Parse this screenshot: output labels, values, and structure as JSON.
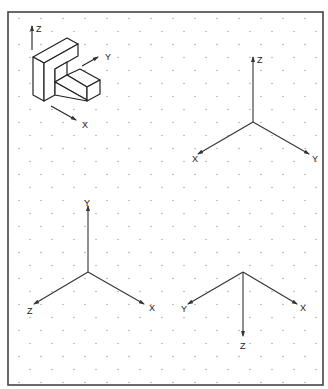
{
  "diagram": {
    "frame_color": "#444444",
    "dot_color": "#9a9a9a",
    "line_color": "#333333",
    "example_object": {
      "description": "Isometric L-shaped block with coordinate axes",
      "axis_labels": {
        "z": "Z",
        "y": "Y",
        "x": "X"
      }
    },
    "axis_sets": [
      {
        "name": "top-right",
        "labels": {
          "up": "Z",
          "left": "X",
          "right": "Y"
        }
      },
      {
        "name": "bottom-left",
        "labels": {
          "up": "Y",
          "left": "Z",
          "right": "X"
        }
      },
      {
        "name": "bottom-right",
        "labels": {
          "down": "Z",
          "left": "Y",
          "right": "X"
        }
      }
    ]
  }
}
